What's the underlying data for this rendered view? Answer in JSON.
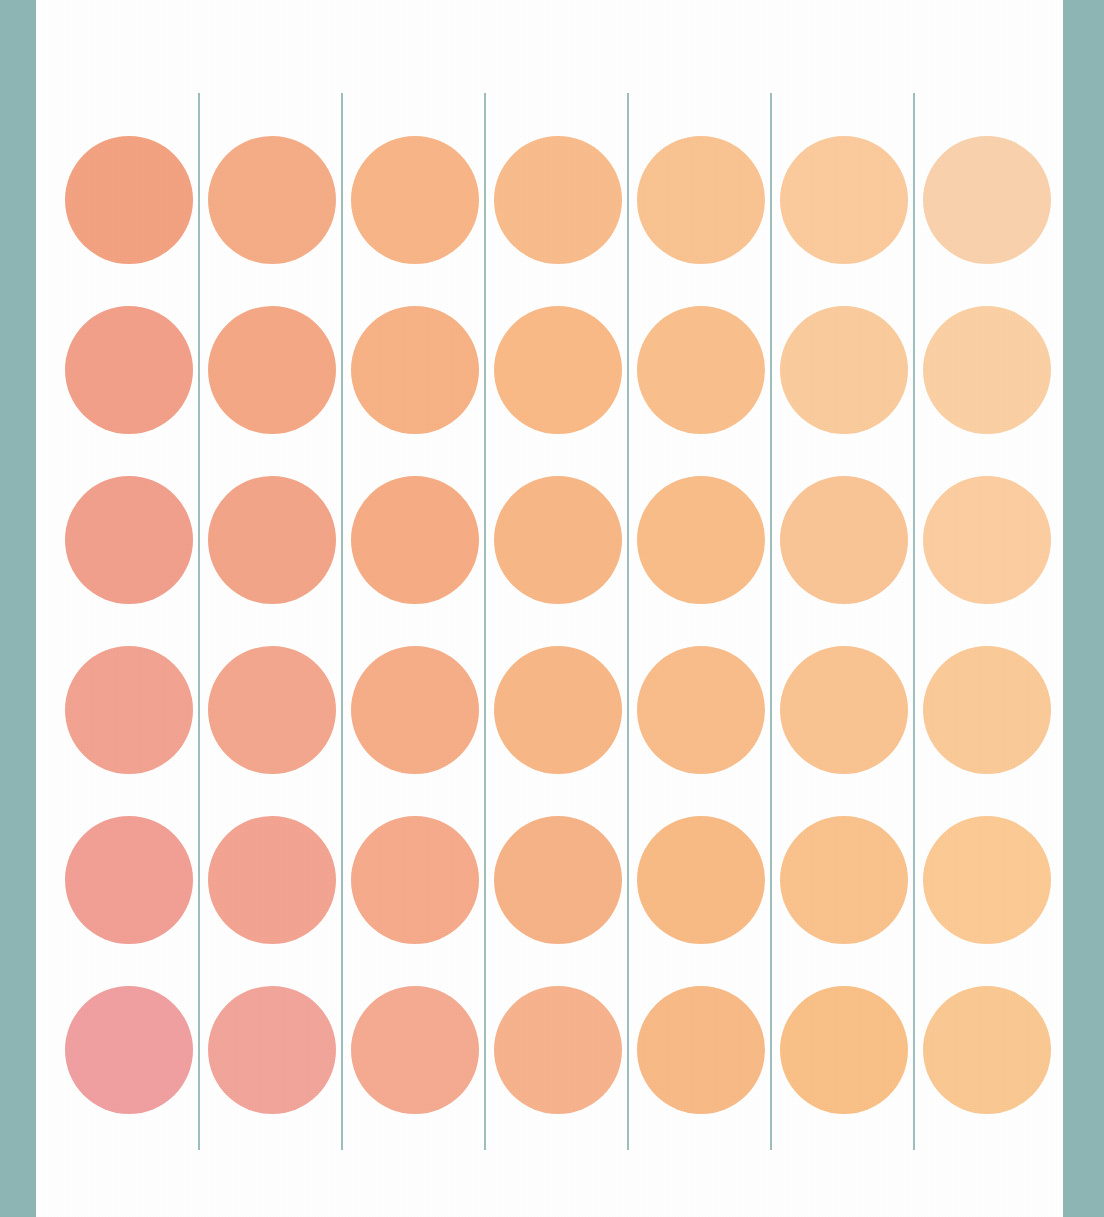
{
  "page": {
    "width": 1104,
    "height": 1217,
    "background_color": "#ffffff",
    "border_color": "#8db6b4",
    "border_left_width": 36,
    "border_right_width": 41
  },
  "grid": {
    "columns": 7,
    "rows": 6,
    "circle_diameter": 128,
    "column_pitch": 143,
    "row_pitch": 170,
    "first_circle_left": 29,
    "first_circle_top": 136,
    "rule_color": "#9fbfbd",
    "rule_width": 2,
    "rule_top": 93,
    "rule_height": 1057,
    "rule_x_positions": [
      162,
      305,
      448,
      591,
      734,
      877
    ]
  },
  "chart_data": {
    "type": "heatmap",
    "title": "",
    "subtitle": "",
    "xlabel": "",
    "ylabel": "",
    "grid": true,
    "legend": "none",
    "marker": "circle",
    "columns": [
      "C1",
      "C2",
      "C3",
      "C4",
      "C5",
      "C6",
      "C7"
    ],
    "rows": [
      "R1",
      "R2",
      "R3",
      "R4",
      "R5",
      "R6"
    ],
    "colors": [
      [
        "#f3a282",
        "#f5ad88",
        "#f8b588",
        "#f9bc8c",
        "#fac392",
        "#fbcb9e",
        "#f9d2ad"
      ],
      [
        "#f2a089",
        "#f4a886",
        "#f7b286",
        "#f9ba88",
        "#f9c08e",
        "#facb9c",
        "#fad0a4"
      ],
      [
        "#f1a08d",
        "#f3a589",
        "#f6ad85",
        "#f8b786",
        "#f9bd89",
        "#fac596",
        "#fbcda0"
      ],
      [
        "#f2a392",
        "#f3a78e",
        "#f6ae89",
        "#f8b787",
        "#f9bd8b",
        "#fac492",
        "#fbca99"
      ],
      [
        "#f2a096",
        "#f3a492",
        "#f5ab8c",
        "#f7b388",
        "#f9bb85",
        "#fac28d",
        "#fbca95"
      ],
      [
        "#f0a0a0",
        "#f2a59a",
        "#f4ab92",
        "#f6b38d",
        "#f8ba86",
        "#f9c187",
        "#fac892"
      ]
    ],
    "values": [
      [
        1,
        2,
        3,
        4,
        5,
        6,
        7
      ],
      [
        8,
        9,
        10,
        11,
        12,
        13,
        14
      ],
      [
        15,
        16,
        17,
        18,
        19,
        20,
        21
      ],
      [
        22,
        23,
        24,
        25,
        26,
        27,
        28
      ],
      [
        29,
        30,
        31,
        32,
        33,
        34,
        35
      ],
      [
        36,
        37,
        38,
        39,
        40,
        41,
        42
      ]
    ]
  }
}
